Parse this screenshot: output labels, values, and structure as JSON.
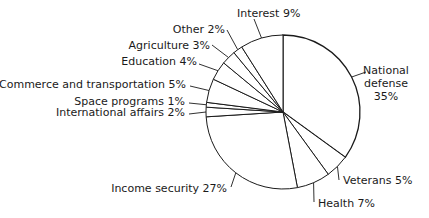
{
  "chart_data": {
    "type": "pie",
    "title": "",
    "start_angle_deg": 0,
    "direction": "clockwise",
    "slices": [
      {
        "label": "National defense",
        "value": 35,
        "text": [
          "National",
          "defense",
          "35%"
        ]
      },
      {
        "label": "Veterans",
        "value": 5,
        "text": [
          "Veterans 5%"
        ]
      },
      {
        "label": "Health",
        "value": 7,
        "text": [
          "Health 7%"
        ]
      },
      {
        "label": "Income security",
        "value": 27,
        "text": [
          "Income security 27%"
        ]
      },
      {
        "label": "International affairs",
        "value": 2,
        "text": [
          "International affairs 2%"
        ]
      },
      {
        "label": "Space programs",
        "value": 1,
        "text": [
          "Space programs 1%"
        ]
      },
      {
        "label": "Commerce and transportation",
        "value": 5,
        "text": [
          "Commerce and transportation 5%"
        ]
      },
      {
        "label": "Education",
        "value": 4,
        "text": [
          "Education 4%"
        ]
      },
      {
        "label": "Agriculture",
        "value": 3,
        "text": [
          "Agriculture 3%"
        ]
      },
      {
        "label": "Other",
        "value": 2,
        "text": [
          "Other 2%"
        ]
      },
      {
        "label": "Interest",
        "value": 9,
        "text": [
          "Interest 9%"
        ]
      }
    ],
    "colors": {
      "fill": "#ffffff",
      "stroke": "#1a1a1a"
    }
  }
}
